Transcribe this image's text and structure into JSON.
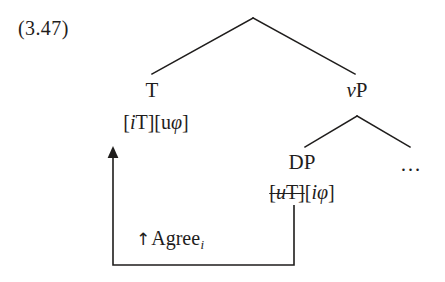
{
  "figure": {
    "example_number": "(3.47)",
    "caption_text": "",
    "ink_color": "#1f1d1c",
    "background_color": "#ffffff"
  },
  "tree": {
    "root": {
      "label": "",
      "apex": {
        "x": 253,
        "y": 18
      }
    },
    "nodes": [
      {
        "id": "T",
        "label": "T",
        "x": 152,
        "y": 80,
        "features": {
          "text": "[iT][uφ]",
          "parts": [
            {
              "text": "[",
              "style": "upright",
              "struck": false
            },
            {
              "text": "i",
              "style": "italic",
              "struck": false
            },
            {
              "text": "T]",
              "style": "upright",
              "struck": false
            },
            {
              "text": "[u",
              "style": "upright",
              "struck": false
            },
            {
              "text": "φ",
              "style": "italic",
              "struck": false
            },
            {
              "text": "]",
              "style": "upright",
              "struck": false
            }
          ]
        }
      },
      {
        "id": "vP",
        "label": "vP",
        "x": 357,
        "y": 80,
        "label_parts": [
          {
            "text": "v",
            "style": "italic"
          },
          {
            "text": "P",
            "style": "upright"
          }
        ],
        "features": null
      },
      {
        "id": "DP",
        "label": "DP",
        "x": 302,
        "y": 152,
        "features": {
          "text": "[uT][iφ]",
          "parts": [
            {
              "text": "[",
              "style": "upright",
              "struck": true
            },
            {
              "text": "u",
              "style": "italic",
              "struck": true
            },
            {
              "text": "T]",
              "style": "upright",
              "struck": true
            },
            {
              "text": "[",
              "style": "upright",
              "struck": false
            },
            {
              "text": "i",
              "style": "italic",
              "struck": false
            },
            {
              "text": "φ",
              "style": "italic",
              "struck": false
            },
            {
              "text": "]",
              "style": "upright",
              "struck": false
            }
          ]
        }
      },
      {
        "id": "ellipsis",
        "label": "…",
        "x": 411,
        "y": 154,
        "features": null
      }
    ],
    "branches": [
      {
        "from": "root-apex",
        "to": "T",
        "x1": 253,
        "y1": 18,
        "x2": 152,
        "y2": 74
      },
      {
        "from": "root-apex",
        "to": "vP",
        "x1": 253,
        "y1": 18,
        "x2": 355,
        "y2": 74
      },
      {
        "from": "vP",
        "to": "DP",
        "x1": 357,
        "y1": 116,
        "x2": 305,
        "y2": 147
      },
      {
        "from": "vP",
        "to": "ellipsis",
        "x1": 357,
        "y1": 116,
        "x2": 410,
        "y2": 147
      }
    ]
  },
  "agree_relation": {
    "label": "↑Agree",
    "arrow_glyph": "↑",
    "label_text": "Agree",
    "subscript": "i",
    "path": {
      "arrow_tip": {
        "x": 113,
        "y": 150
      },
      "left_riser": {
        "x": 113,
        "y_top": 150,
        "y_bottom": 265
      },
      "bottom_rail": {
        "y": 265,
        "x_left": 113,
        "x_right": 294
      },
      "right_riser": {
        "x": 294,
        "y_top": 205,
        "y_bottom": 265
      }
    }
  }
}
